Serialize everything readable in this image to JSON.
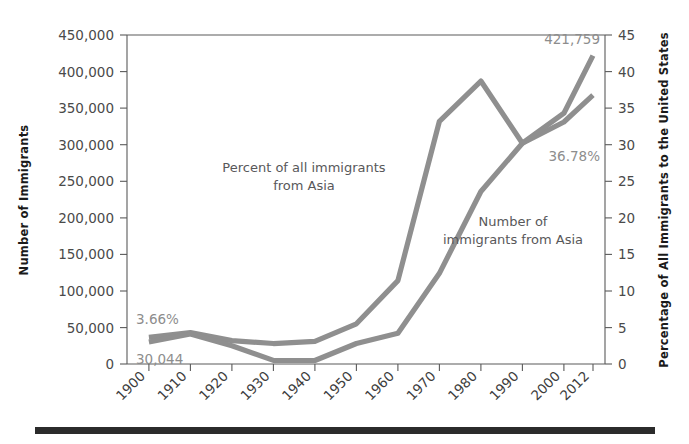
{
  "chart_data": {
    "type": "line",
    "title": "",
    "xlabel": "",
    "categories": [
      "1900",
      "1910",
      "1920",
      "1930",
      "1940",
      "1950",
      "1960",
      "1970",
      "1980",
      "1990",
      "2000",
      "2012"
    ],
    "grid": false,
    "legend": "inline-annotations",
    "left_axis": {
      "label": "Number of Immigrants",
      "ticks": [
        "0",
        "50,000",
        "100,000",
        "150,000",
        "200,000",
        "250,000",
        "300,000",
        "350,000",
        "400,000",
        "450,000"
      ],
      "tick_values": [
        0,
        50000,
        100000,
        150000,
        200000,
        250000,
        300000,
        350000,
        400000,
        450000
      ],
      "ylim": [
        0,
        450000
      ]
    },
    "right_axis": {
      "label": "Percentage of All Immigrants to the United States",
      "ticks": [
        "0",
        "5",
        "10",
        "15",
        "20",
        "25",
        "30",
        "35",
        "40",
        "45"
      ],
      "tick_values": [
        0,
        5,
        10,
        15,
        20,
        25,
        30,
        35,
        40,
        45
      ],
      "ylim": [
        0,
        45
      ]
    },
    "series": [
      {
        "name": "Number of immigrants from Asia",
        "axis": "left",
        "values": [
          30044,
          41000,
          25000,
          4900,
          4800,
          28000,
          42000,
          124000,
          236000,
          302000,
          343000,
          421759
        ],
        "annotation": "Number of\nimmigrants from Asia",
        "start_label": "30,044",
        "end_label": "421,759"
      },
      {
        "name": "Percent of all immigrants from Asia",
        "axis": "right",
        "values": [
          3.66,
          4.3,
          3.2,
          2.8,
          3.1,
          5.5,
          11.4,
          33.2,
          38.7,
          30.2,
          33.1,
          36.78
        ],
        "annotation": "Percent of all immigrants\nfrom Asia",
        "start_label": "3.66%",
        "end_label": "36.78%"
      }
    ],
    "annotations": [
      {
        "id": "percent-annotation",
        "line1": "Percent of all immigrants",
        "line2": "from Asia"
      },
      {
        "id": "number-annotation",
        "line1": "Number of",
        "line2": "immigrants from Asia"
      }
    ],
    "data_labels": {
      "start_percent": "3.66%",
      "start_number": "30,044",
      "end_number": "421,759",
      "end_percent": "36.78%"
    },
    "series_color": "#8f8f8f"
  },
  "axes": {
    "left_title": "Number of Immigrants",
    "right_title": "Percentage of All Immigrants to the United States",
    "y_left_ticks": [
      "450,000",
      "400,000",
      "350,000",
      "300,000",
      "250,000",
      "200,000",
      "150,000",
      "100,000",
      "50,000",
      "0"
    ],
    "y_right_ticks": [
      "45",
      "40",
      "35",
      "30",
      "25",
      "20",
      "15",
      "10",
      "5",
      "0"
    ],
    "x_ticks": [
      "1900",
      "1910",
      "1920",
      "1930",
      "1940",
      "1950",
      "1960",
      "1970",
      "1980",
      "1990",
      "2000",
      "2012"
    ]
  }
}
